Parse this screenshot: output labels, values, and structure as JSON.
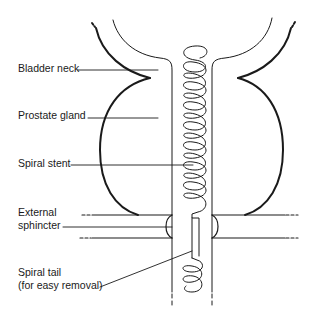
{
  "diagram": {
    "labels": [
      {
        "id": "bladder-neck",
        "text": "Bladder neck"
      },
      {
        "id": "prostate-gland",
        "text": "Prostate gland"
      },
      {
        "id": "spiral-stent",
        "text": "Spiral stent"
      },
      {
        "id": "external-sphincter",
        "lines": [
          "External",
          "sphincter"
        ]
      },
      {
        "id": "spiral-tail",
        "lines": [
          "Spiral tail",
          "(for easy removal)"
        ]
      }
    ],
    "colors": {
      "line": "#1a1a1a",
      "background": "#ffffff"
    }
  }
}
